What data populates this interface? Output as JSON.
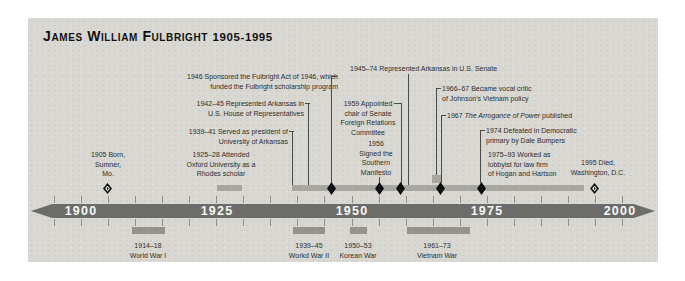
{
  "title": {
    "name": "James William Fulbright",
    "dates": "1905-1995"
  },
  "annotations": {
    "fulbright_act": {
      "text": "1946 Sponsored the Fulbright Act of 1946, which\nfunded the Fulbright scholarship program"
    },
    "house": {
      "text": "1942–45 Represented Arkansas in\nU.S. House of Representatives"
    },
    "president": {
      "text": "1939–41 Served as president of\nUniversity of Arkansas"
    },
    "senate": {
      "text": "1945–74 Represented Arkansas in U.S. Senate"
    },
    "foreign_relations": {
      "text": "1959 Appointed\nchair of Senate\nForeign Relations\nCommittee"
    },
    "vietnam_critic": {
      "text": "1966–67 Became vocal critic\nof Johnson's Vietnam policy"
    },
    "arrogance": {
      "prefix": "1967 ",
      "italic": "The Arrogance of Power",
      "suffix": " published"
    },
    "defeated": {
      "text": "1974 Defeated in Democratic\nprimary by Dale Bumpers"
    },
    "lobbyist": {
      "text": "1975–93 Worked as\nlobbyist for law firm\nof Hogan and Hartson"
    },
    "manifesto": {
      "text": "1956\nSigned the\nSouthern\nManifesto"
    },
    "born": {
      "text": "1905 Born,\nSumner,\nMo."
    },
    "oxford": {
      "text": "1925–28 Attended\nOxford University as a\nRhodes scholar"
    },
    "died": {
      "text": "1995 Died,\nWashington, D.C."
    }
  },
  "axis": {
    "years": [
      "1900",
      "1925",
      "1950",
      "1975",
      "2000"
    ]
  },
  "wars": [
    {
      "text": "1914–18\nWorld War I"
    },
    {
      "text": "1939–45\nWorkd War II"
    },
    {
      "text": "1950–53\nKorean War"
    },
    {
      "text": "1961–73\nVietnam War"
    }
  ],
  "colors": {
    "panel_bg": "#d8d7d2",
    "axis_bar": "#6c6c6a",
    "axis_text": "#f6f6f4",
    "period_bar": "#a7a6a1",
    "war_bar": "#94938e",
    "tick": "#8f8e89",
    "diamond": "#0e0e0e",
    "connector": "#4b4b49",
    "text": "#2f2f2d",
    "title": "#121212"
  }
}
